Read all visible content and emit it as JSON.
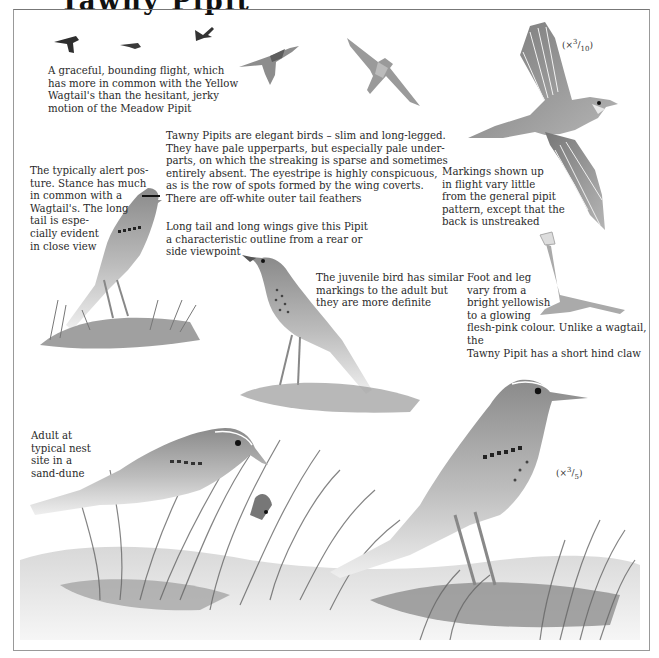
{
  "page": {
    "heading_partial": "Tawny Pipit"
  },
  "captions": {
    "flight": "A graceful, bounding flight, which has more in common with the Yellow Wagtail's than the hesitant, jerky motion of the Meadow Pipit",
    "description": "Tawny Pipits are elegant birds – slim and long-legged. They have pale upperparts, but especially pale under-parts, on which the streaking is sparse and sometimes entirely absent. The eyestripe is highly conspicuous, as is the row of spots formed by the wing coverts. There are off-white outer tail feathers",
    "posture": "The typically alert pos-ture. Stance has much in common with a Wagtail's. The long tail is espe-cially evident in close view",
    "outline": "Long tail and long wings give this Pipit a characteristic outline from a rear or side viewpoint",
    "juvenile": "The juvenile bird has similar markings to the adult but they are more definite",
    "markings_flight": "Markings shown up in flight vary little from the general pipit pattern, except that the back is unstreaked",
    "foot": "Foot and leg vary from a bright yellowish to a glowing flesh-pink colour. Unlike a wagtail, the Tawny Pipit has a short hind claw",
    "nest": "Adult at typical nest site in a sand-dune"
  },
  "caption_lines": {
    "flight": [
      "A graceful, bounding flight, which",
      "has more in common with the Yellow",
      "Wagtail's than the hesitant, jerky",
      "motion of the Meadow Pipit"
    ],
    "description": [
      "Tawny Pipits are elegant birds – slim and long-legged.",
      "They have pale upperparts, but especially pale under-",
      "parts, on which the streaking is sparse and sometimes",
      "entirely absent. The eyestripe is highly conspicuous,",
      "as is the row of spots formed by the wing coverts.",
      "There are off-white outer tail feathers"
    ],
    "posture": [
      "The typically alert pos-",
      "ture. Stance has much",
      "in common with a",
      "Wagtail's. The long",
      "tail is espe-",
      "cially evident",
      "in close view"
    ],
    "outline": [
      "Long tail and long wings give this Pipit",
      "a characteristic outline from a rear or",
      "side viewpoint"
    ],
    "juvenile": [
      "The juvenile bird has similar",
      "markings to the adult but",
      "they are more definite"
    ],
    "markings_flight": [
      "Markings shown up",
      "in flight vary little",
      "from the general pipit",
      "pattern, except that the",
      "back is unstreaked"
    ],
    "foot": [
      "Foot and leg",
      "vary from a",
      "bright yellowish",
      "to a glowing",
      "flesh-pink colour. Unlike a wagtail, the",
      "Tawny Pipit has a short hind claw"
    ],
    "nest": [
      "Adult at",
      "typical nest",
      "site in a",
      "sand-dune"
    ]
  },
  "scales": {
    "flight_bird": {
      "prefix": "(×",
      "num": "3",
      "den": "10",
      "suffix": ")"
    },
    "standing_bird": {
      "prefix": "(×",
      "num": "3",
      "den": "5",
      "suffix": ")"
    }
  },
  "illustrations": [
    "flying-bird-silhouette-1",
    "flying-bird-silhouette-2",
    "flying-bird-silhouette-3",
    "flying-bird-side",
    "flying-bird-below",
    "flying-bird-large",
    "perched-bird-alert",
    "juvenile-bird",
    "foot-and-leg",
    "adult-at-nest",
    "standing-adult",
    "sand-dune-ground"
  ]
}
